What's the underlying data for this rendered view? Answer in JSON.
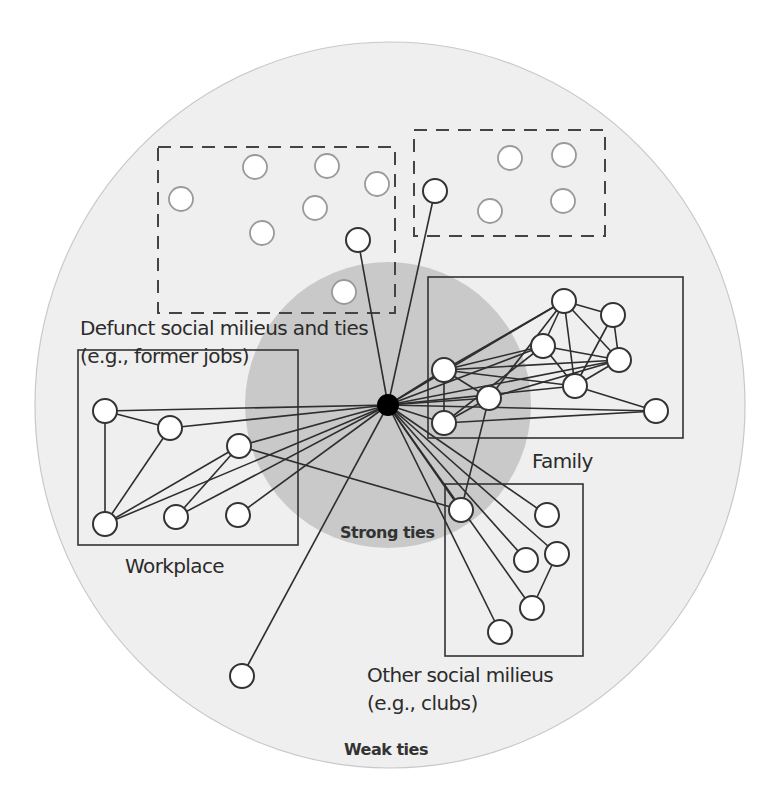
{
  "colors": {
    "background": "#ffffff",
    "weak_ties_fill": "#efefef",
    "weak_ties_stroke": "#c8c8c8",
    "strong_ties_fill": "#c9c9c9",
    "line": "#2e2e2e",
    "node_fill": "#ffffff",
    "node_stroke_active": "#333333",
    "node_stroke_faded": "#9a9a9a",
    "ego_fill": "#000000"
  },
  "regions": {
    "weak_ties": {
      "label": "Weak ties",
      "cx": 390,
      "cy": 405,
      "rx": 355,
      "ry": 363
    },
    "strong_ties": {
      "label": "Strong ties",
      "cx": 388,
      "cy": 405,
      "r": 143
    }
  },
  "ego": {
    "x": 388,
    "y": 405,
    "r": 11
  },
  "groups": {
    "defunct": {
      "label_line1": "Defunct social milieus and ties",
      "label_line2": "(e.g., former jobs)",
      "boxes": [
        {
          "x": 158,
          "y": 147,
          "w": 237,
          "h": 166
        },
        {
          "x": 414,
          "y": 130,
          "w": 191,
          "h": 106
        }
      ],
      "faded_nodes": [
        [
          181,
          199
        ],
        [
          255,
          167
        ],
        [
          327,
          166
        ],
        [
          377,
          184
        ],
        [
          315,
          208
        ],
        [
          262,
          233
        ],
        [
          344,
          292
        ],
        [
          510,
          158
        ],
        [
          564,
          155
        ],
        [
          490,
          211
        ],
        [
          563,
          201
        ]
      ],
      "active_nodes": [
        [
          358,
          240
        ],
        [
          435,
          191
        ]
      ]
    },
    "family": {
      "label": "Family",
      "box": {
        "x": 428,
        "y": 277,
        "w": 255,
        "h": 161
      },
      "nodes": [
        [
          564,
          301
        ],
        [
          613,
          315
        ],
        [
          543,
          346
        ],
        [
          619,
          360
        ],
        [
          444,
          370
        ],
        [
          575,
          386
        ],
        [
          489,
          398
        ],
        [
          444,
          423
        ],
        [
          656,
          411
        ]
      ]
    },
    "workplace": {
      "label": "Workplace",
      "box": {
        "x": 78,
        "y": 350,
        "w": 220,
        "h": 195
      },
      "nodes": [
        [
          105,
          411
        ],
        [
          170,
          428
        ],
        [
          239,
          446
        ],
        [
          105,
          524
        ],
        [
          176,
          517
        ],
        [
          238,
          515
        ]
      ]
    },
    "other": {
      "label_line1": "Other social milieus",
      "label_line2": "(e.g., clubs)",
      "box": {
        "x": 445,
        "y": 484,
        "w": 138,
        "h": 172
      },
      "nodes": [
        [
          461,
          510
        ],
        [
          547,
          515
        ],
        [
          526,
          560
        ],
        [
          557,
          554
        ],
        [
          532,
          608
        ],
        [
          500,
          632
        ]
      ]
    },
    "isolated": {
      "nodes": [
        [
          242,
          676
        ]
      ]
    }
  },
  "edges_from_ego": [
    [
      358,
      240
    ],
    [
      435,
      191
    ],
    [
      105,
      411
    ],
    [
      170,
      428
    ],
    [
      239,
      446
    ],
    [
      105,
      524
    ],
    [
      176,
      517
    ],
    [
      238,
      515
    ],
    [
      564,
      301
    ],
    [
      543,
      346
    ],
    [
      444,
      370
    ],
    [
      619,
      360
    ],
    [
      575,
      386
    ],
    [
      489,
      398
    ],
    [
      444,
      423
    ],
    [
      656,
      411
    ],
    [
      461,
      510
    ],
    [
      547,
      515
    ],
    [
      526,
      560
    ],
    [
      557,
      554
    ],
    [
      532,
      608
    ],
    [
      500,
      632
    ],
    [
      242,
      676
    ]
  ],
  "internal_edges": [
    [
      [
        105,
        411
      ],
      [
        170,
        428
      ]
    ],
    [
      [
        105,
        411
      ],
      [
        105,
        524
      ]
    ],
    [
      [
        170,
        428
      ],
      [
        105,
        524
      ]
    ],
    [
      [
        239,
        446
      ],
      [
        176,
        517
      ]
    ],
    [
      [
        105,
        524
      ],
      [
        239,
        446
      ]
    ],
    [
      [
        564,
        301
      ],
      [
        613,
        315
      ]
    ],
    [
      [
        564,
        301
      ],
      [
        543,
        346
      ]
    ],
    [
      [
        564,
        301
      ],
      [
        575,
        386
      ]
    ],
    [
      [
        564,
        301
      ],
      [
        619,
        360
      ]
    ],
    [
      [
        613,
        315
      ],
      [
        619,
        360
      ]
    ],
    [
      [
        613,
        315
      ],
      [
        575,
        386
      ]
    ],
    [
      [
        543,
        346
      ],
      [
        619,
        360
      ]
    ],
    [
      [
        543,
        346
      ],
      [
        575,
        386
      ]
    ],
    [
      [
        619,
        360
      ],
      [
        575,
        386
      ]
    ],
    [
      [
        444,
        370
      ],
      [
        564,
        301
      ]
    ],
    [
      [
        444,
        370
      ],
      [
        543,
        346
      ]
    ],
    [
      [
        444,
        370
      ],
      [
        619,
        360
      ]
    ],
    [
      [
        444,
        370
      ],
      [
        575,
        386
      ]
    ],
    [
      [
        444,
        370
      ],
      [
        444,
        423
      ]
    ],
    [
      [
        444,
        370
      ],
      [
        489,
        398
      ]
    ],
    [
      [
        489,
        398
      ],
      [
        444,
        423
      ]
    ],
    [
      [
        489,
        398
      ],
      [
        564,
        301
      ]
    ],
    [
      [
        489,
        398
      ],
      [
        619,
        360
      ]
    ],
    [
      [
        444,
        423
      ],
      [
        543,
        346
      ]
    ],
    [
      [
        444,
        423
      ],
      [
        656,
        411
      ]
    ],
    [
      [
        575,
        386
      ],
      [
        656,
        411
      ]
    ],
    [
      [
        489,
        398
      ],
      [
        461,
        510
      ]
    ],
    [
      [
        239,
        446
      ],
      [
        461,
        510
      ]
    ],
    [
      [
        557,
        554
      ],
      [
        532,
        608
      ]
    ]
  ]
}
